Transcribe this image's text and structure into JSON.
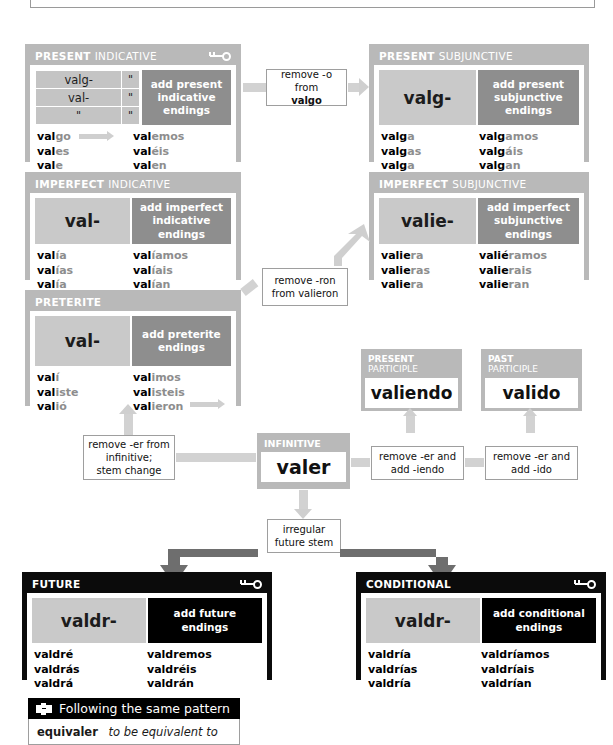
{
  "meta": {
    "verb": "valer",
    "key_icon": "key-icon",
    "ditto": "\""
  },
  "present_indicative": {
    "title_strong": "PRESENT",
    "title_light": "INDICATIVE",
    "has_key": true,
    "grid": [
      [
        "valg-",
        "\""
      ],
      [
        "val-",
        "\""
      ],
      [
        "\"",
        "\""
      ]
    ],
    "endings_label": "add present\nindicative\nendings",
    "forms": [
      {
        "stem": "val",
        "ending": "go"
      },
      {
        "stem": "val",
        "ending": "es"
      },
      {
        "stem": "val",
        "ending": "e"
      },
      {
        "stem": "val",
        "ending": "emos"
      },
      {
        "stem": "val",
        "ending": "éis"
      },
      {
        "stem": "val",
        "ending": "en"
      }
    ]
  },
  "present_subjunctive": {
    "title_strong": "PRESENT",
    "title_light": "SUBJUNCTIVE",
    "has_key": false,
    "stem": "valg-",
    "endings_label": "add present\nsubjunctive\nendings",
    "forms": [
      {
        "stem": "valg",
        "ending": "a"
      },
      {
        "stem": "valg",
        "ending": "as"
      },
      {
        "stem": "valg",
        "ending": "a"
      },
      {
        "stem": "valg",
        "ending": "amos"
      },
      {
        "stem": "valg",
        "ending": "áis"
      },
      {
        "stem": "valg",
        "ending": "an"
      }
    ]
  },
  "imperfect_indicative": {
    "title_strong": "IMPERFECT",
    "title_light": "INDICATIVE",
    "has_key": false,
    "stem": "val-",
    "endings_label": "add imperfect\nindicative\nendings",
    "forms": [
      {
        "stem": "val",
        "ending": "ía"
      },
      {
        "stem": "val",
        "ending": "ías"
      },
      {
        "stem": "val",
        "ending": "ía"
      },
      {
        "stem": "val",
        "ending": "íamos"
      },
      {
        "stem": "val",
        "ending": "íais"
      },
      {
        "stem": "val",
        "ending": "ían"
      }
    ]
  },
  "imperfect_subjunctive": {
    "title_strong": "IMPERFECT",
    "title_light": "SUBJUNCTIVE",
    "has_key": false,
    "stem": "valie-",
    "endings_label": "add imperfect\nsubjunctive\nendings",
    "forms": [
      {
        "stem": "valie",
        "ending": "ra"
      },
      {
        "stem": "valie",
        "ending": "ras"
      },
      {
        "stem": "valie",
        "ending": "ra"
      },
      {
        "stem": "valié",
        "ending": "ramos"
      },
      {
        "stem": "valie",
        "ending": "rais"
      },
      {
        "stem": "valie",
        "ending": "ran"
      }
    ]
  },
  "preterite": {
    "title_strong": "PRETERITE",
    "title_light": "",
    "has_key": false,
    "stem": "val-",
    "endings_label": "add preterite\nendings",
    "forms": [
      {
        "stem": "val",
        "ending": "í"
      },
      {
        "stem": "val",
        "ending": "iste"
      },
      {
        "stem": "val",
        "ending": "ió"
      },
      {
        "stem": "val",
        "ending": "imos"
      },
      {
        "stem": "val",
        "ending": "isteis"
      },
      {
        "stem": "val",
        "ending": "ieron"
      }
    ]
  },
  "future": {
    "title_strong": "FUTURE",
    "title_light": "",
    "has_key": true,
    "dark": true,
    "stem": "valdr-",
    "endings_label": "add future\nendings",
    "forms": [
      {
        "stem": "valdré",
        "ending": ""
      },
      {
        "stem": "valdrás",
        "ending": ""
      },
      {
        "stem": "valdrá",
        "ending": ""
      },
      {
        "stem": "valdremos",
        "ending": ""
      },
      {
        "stem": "valdréis",
        "ending": ""
      },
      {
        "stem": "valdrán",
        "ending": ""
      }
    ]
  },
  "conditional": {
    "title_strong": "CONDITIONAL",
    "title_light": "",
    "has_key": true,
    "dark": true,
    "stem": "valdr-",
    "endings_label": "add conditional\nendings",
    "forms": [
      {
        "stem": "valdría",
        "ending": ""
      },
      {
        "stem": "valdrías",
        "ending": ""
      },
      {
        "stem": "valdría",
        "ending": ""
      },
      {
        "stem": "valdríamos",
        "ending": ""
      },
      {
        "stem": "valdríais",
        "ending": ""
      },
      {
        "stem": "valdrían",
        "ending": ""
      }
    ]
  },
  "present_participle": {
    "title_strong": "PRESENT",
    "title_light": "PARTICIPLE",
    "value": "valiendo"
  },
  "past_participle": {
    "title_strong": "PAST",
    "title_light": "PARTICIPLE",
    "value": "valido"
  },
  "infinitive": {
    "title": "INFINITIVE",
    "value": "valer"
  },
  "notes": {
    "remove_o": "remove -o from valgo",
    "remove_o_a": "remove -o from",
    "remove_o_b": "valgo",
    "remove_ron_a": "remove -ron",
    "remove_ron_b": "from valieron",
    "stem_change_a": "remove -er from",
    "stem_change_b": "infinitive;",
    "stem_change_c": "stem change",
    "iendo_a": "remove -er and",
    "iendo_b": "add -iendo",
    "ido_a": "remove -er and",
    "ido_b": "add -ido",
    "future_stem_a": "irregular",
    "future_stem_b": "future stem"
  },
  "pattern": {
    "heading": "Following the same pattern",
    "icon": "puzzle-piece-icon",
    "entries": [
      {
        "word": "equivaler",
        "meaning": "to be equivalent to"
      }
    ]
  }
}
